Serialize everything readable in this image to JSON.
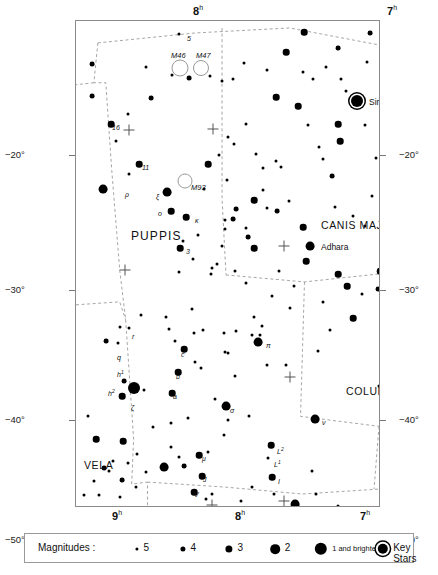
{
  "chart_data": {
    "type": "scatter",
    "xlabel": "Right Ascension",
    "ylabel": "Declination",
    "xlim_hours": [
      9,
      6
    ],
    "ylim_deg": [
      -50,
      -12
    ],
    "grid": false,
    "ra_ticks_top": [
      {
        "label": "8",
        "sup": "h",
        "x": 118
      },
      {
        "label": "7",
        "sup": "h",
        "x": 312
      }
    ],
    "ra_ticks_bottom": [
      {
        "label": "9",
        "sup": "h",
        "x": 37
      },
      {
        "label": "8",
        "sup": "h",
        "x": 160
      },
      {
        "label": "7",
        "sup": "h",
        "x": 285
      },
      {
        "label": "6",
        "sup": "h",
        "x": 394
      }
    ],
    "dec_ticks_left": [
      {
        "label": "−20°",
        "y": 135
      },
      {
        "label": "−30°",
        "y": 270
      },
      {
        "label": "−40°",
        "y": 400
      },
      {
        "label": "−50°",
        "y": 520
      }
    ],
    "dec_ticks_right": [
      {
        "label": "−20°",
        "y": 135
      },
      {
        "label": "−30°",
        "y": 270
      },
      {
        "label": "−40°",
        "y": 400
      },
      {
        "label": "−50°",
        "y": 520
      }
    ],
    "constellations": [
      {
        "name": "PUPPIS",
        "x": 55,
        "y": 208,
        "size": "big"
      },
      {
        "name": "CANIS MAJOR",
        "x": 245,
        "y": 198,
        "size": "norm"
      },
      {
        "name": "PYXIS",
        "x": -35,
        "y": 266,
        "size": "norm"
      },
      {
        "name": "COLUMBA",
        "x": 270,
        "y": 364,
        "size": "norm"
      },
      {
        "name": "VELA",
        "x": 8,
        "y": 438,
        "size": "norm"
      },
      {
        "name": "CARINA",
        "x": 120,
        "y": 498,
        "size": "norm"
      }
    ],
    "named_stars": [
      {
        "name": "Sirius",
        "x": 281,
        "y": 80,
        "label_dx": 12,
        "label_dy": -4
      },
      {
        "name": "Adhara",
        "x": 234,
        "y": 225,
        "label_dx": 11,
        "label_dy": -4
      }
    ],
    "deep_sky": [
      {
        "name": "M46",
        "x": 104,
        "y": 47,
        "r": 7.5,
        "label_dx": -9,
        "label_dy": -17
      },
      {
        "name": "M47",
        "x": 125,
        "y": 47,
        "r": 7.0,
        "label_dx": -5,
        "label_dy": -17
      },
      {
        "name": "M93",
        "x": 109,
        "y": 160,
        "r": 6.5,
        "label_dx": 6,
        "label_dy": 2
      }
    ],
    "star_labels": [
      {
        "text": "5",
        "x": 111,
        "y": 14,
        "sup": ""
      },
      {
        "text": "16",
        "x": 36,
        "y": 103,
        "sup": ""
      },
      {
        "text": "11",
        "x": 66,
        "y": 143,
        "sup": ""
      },
      {
        "text": "ρ",
        "x": 49,
        "y": 170,
        "sup": ""
      },
      {
        "text": "ξ",
        "x": 80,
        "y": 172,
        "sup": ""
      },
      {
        "text": "o",
        "x": 82,
        "y": 189,
        "sup": ""
      },
      {
        "text": "κ",
        "x": 119,
        "y": 196,
        "sup": ""
      },
      {
        "text": "3",
        "x": 110,
        "y": 227,
        "sup": ""
      },
      {
        "text": "r",
        "x": 56,
        "y": 312,
        "sup": ""
      },
      {
        "text": "q",
        "x": 41,
        "y": 333,
        "sup": ""
      },
      {
        "text": "c",
        "x": 105,
        "y": 330,
        "sup": ""
      },
      {
        "text": "b",
        "x": 100,
        "y": 352,
        "sup": ""
      },
      {
        "text": "a",
        "x": 97,
        "y": 372,
        "sup": ""
      },
      {
        "text": "h",
        "x": 41,
        "y": 348,
        "sup": "1"
      },
      {
        "text": "h",
        "x": 32,
        "y": 367,
        "sup": "2"
      },
      {
        "text": "ζ",
        "x": 55,
        "y": 383,
        "sup": ""
      },
      {
        "text": "π",
        "x": 190,
        "y": 321,
        "sup": ""
      },
      {
        "text": "σ",
        "x": 154,
        "y": 386,
        "sup": ""
      },
      {
        "text": "ν",
        "x": 246,
        "y": 398,
        "sup": ""
      },
      {
        "text": "L",
        "x": 201,
        "y": 425,
        "sup": "2"
      },
      {
        "text": "L",
        "x": 198,
        "y": 438,
        "sup": "1"
      },
      {
        "text": "I",
        "x": 202,
        "y": 457,
        "sup": ""
      },
      {
        "text": "τ",
        "x": 228,
        "y": 484,
        "sup": ""
      },
      {
        "text": "μ",
        "x": 126,
        "y": 434,
        "sup": ""
      },
      {
        "text": "J",
        "x": 127,
        "y": 455,
        "sup": ""
      },
      {
        "text": "V",
        "x": 118,
        "y": 470,
        "sup": ""
      }
    ],
    "crosses": [
      {
        "x": 53,
        "y": 109
      },
      {
        "x": 49,
        "y": 249
      },
      {
        "x": 137,
        "y": 108
      },
      {
        "x": 208,
        "y": 225
      },
      {
        "x": 214,
        "y": 356
      },
      {
        "x": 136,
        "y": 484
      },
      {
        "x": 208,
        "y": 480
      }
    ],
    "stars": [
      {
        "x": 103,
        "y": 13,
        "m": 5
      },
      {
        "x": 70,
        "y": 46,
        "m": 5
      },
      {
        "x": 16,
        "y": 43,
        "m": 4
      },
      {
        "x": 16,
        "y": 75,
        "m": 4
      },
      {
        "x": 96,
        "y": 54,
        "m": 5
      },
      {
        "x": 113,
        "y": 57,
        "m": 4
      },
      {
        "x": 134,
        "y": 55,
        "m": 5
      },
      {
        "x": 146,
        "y": 60,
        "m": 5
      },
      {
        "x": 75,
        "y": 77,
        "m": 4
      },
      {
        "x": 52,
        "y": 93,
        "m": 5
      },
      {
        "x": 35,
        "y": 103,
        "m": 3
      },
      {
        "x": 40,
        "y": 120,
        "m": 5
      },
      {
        "x": 168,
        "y": 42,
        "m": 5
      },
      {
        "x": 191,
        "y": 49,
        "m": 5
      },
      {
        "x": 157,
        "y": 58,
        "m": 5
      },
      {
        "x": 210,
        "y": 31,
        "m": 3
      },
      {
        "x": 227,
        "y": 51,
        "m": 5
      },
      {
        "x": 250,
        "y": 46,
        "m": 5
      },
      {
        "x": 265,
        "y": 58,
        "m": 5
      },
      {
        "x": 237,
        "y": 58,
        "m": 5
      },
      {
        "x": 270,
        "y": 70,
        "m": 5
      },
      {
        "x": 200,
        "y": 76,
        "m": 3
      },
      {
        "x": 222,
        "y": 85,
        "m": 3
      },
      {
        "x": 262,
        "y": 27,
        "m": 4
      },
      {
        "x": 291,
        "y": 41,
        "m": 5
      },
      {
        "x": 281,
        "y": 80,
        "m": 1,
        "key": true
      },
      {
        "x": 262,
        "y": 103,
        "m": 3
      },
      {
        "x": 264,
        "y": 120,
        "m": 3
      },
      {
        "x": 232,
        "y": 104,
        "m": 5
      },
      {
        "x": 170,
        "y": 103,
        "m": 5
      },
      {
        "x": 152,
        "y": 116,
        "m": 5
      },
      {
        "x": 180,
        "y": 133,
        "m": 5
      },
      {
        "x": 187,
        "y": 147,
        "m": 5
      },
      {
        "x": 63,
        "y": 143,
        "m": 3
      },
      {
        "x": 53,
        "y": 153,
        "m": 5
      },
      {
        "x": 27,
        "y": 168,
        "m": 2
      },
      {
        "x": 91,
        "y": 171,
        "m": 2
      },
      {
        "x": 95,
        "y": 190,
        "m": 3
      },
      {
        "x": 110,
        "y": 196,
        "m": 3
      },
      {
        "x": 104,
        "y": 227,
        "m": 3
      },
      {
        "x": 107,
        "y": 220,
        "m": 5
      },
      {
        "x": 122,
        "y": 214,
        "m": 5
      },
      {
        "x": 132,
        "y": 143,
        "m": 3
      },
      {
        "x": 128,
        "y": 168,
        "m": 5
      },
      {
        "x": 143,
        "y": 134,
        "m": 5
      },
      {
        "x": 151,
        "y": 159,
        "m": 5
      },
      {
        "x": 158,
        "y": 123,
        "m": 5
      },
      {
        "x": 149,
        "y": 199,
        "m": 5
      },
      {
        "x": 136,
        "y": 247,
        "m": 5
      },
      {
        "x": 141,
        "y": 243,
        "m": 5
      },
      {
        "x": 205,
        "y": 146,
        "m": 5
      },
      {
        "x": 200,
        "y": 140,
        "m": 5
      },
      {
        "x": 187,
        "y": 169,
        "m": 5
      },
      {
        "x": 213,
        "y": 180,
        "m": 5
      },
      {
        "x": 178,
        "y": 179,
        "m": 3
      },
      {
        "x": 191,
        "y": 187,
        "m": 5
      },
      {
        "x": 201,
        "y": 190,
        "m": 4
      },
      {
        "x": 160,
        "y": 188,
        "m": 4
      },
      {
        "x": 157,
        "y": 198,
        "m": 4
      },
      {
        "x": 170,
        "y": 207,
        "m": 5
      },
      {
        "x": 149,
        "y": 208,
        "m": 5
      },
      {
        "x": 172,
        "y": 216,
        "m": 4
      },
      {
        "x": 178,
        "y": 227,
        "m": 3
      },
      {
        "x": 234,
        "y": 225,
        "m": 2
      },
      {
        "x": 227,
        "y": 206,
        "m": 3
      },
      {
        "x": 247,
        "y": 138,
        "m": 5
      },
      {
        "x": 256,
        "y": 155,
        "m": 4
      },
      {
        "x": 146,
        "y": 225,
        "m": 5
      },
      {
        "x": 117,
        "y": 238,
        "m": 5
      },
      {
        "x": 159,
        "y": 250,
        "m": 5
      },
      {
        "x": 304,
        "y": 250,
        "m": 3
      },
      {
        "x": 302,
        "y": 268,
        "m": 4
      },
      {
        "x": 135,
        "y": 253,
        "m": 5
      },
      {
        "x": 103,
        "y": 251,
        "m": 5
      },
      {
        "x": 170,
        "y": 262,
        "m": 5
      },
      {
        "x": 196,
        "y": 275,
        "m": 5
      },
      {
        "x": 116,
        "y": 288,
        "m": 5
      },
      {
        "x": 90,
        "y": 296,
        "m": 5
      },
      {
        "x": 65,
        "y": 294,
        "m": 5
      },
      {
        "x": 44,
        "y": 306,
        "m": 5
      },
      {
        "x": 53,
        "y": 307,
        "m": 5
      },
      {
        "x": 93,
        "y": 308,
        "m": 5
      },
      {
        "x": 108,
        "y": 328,
        "m": 3
      },
      {
        "x": 99,
        "y": 320,
        "m": 5
      },
      {
        "x": 118,
        "y": 312,
        "m": 5
      },
      {
        "x": 127,
        "y": 309,
        "m": 5
      },
      {
        "x": 30,
        "y": 320,
        "m": 4
      },
      {
        "x": 42,
        "y": 322,
        "m": 5
      },
      {
        "x": 102,
        "y": 351,
        "m": 3
      },
      {
        "x": 119,
        "y": 341,
        "m": 5
      },
      {
        "x": 125,
        "y": 347,
        "m": 5
      },
      {
        "x": 96,
        "y": 372,
        "m": 3
      },
      {
        "x": 58,
        "y": 367,
        "m": 1
      },
      {
        "x": 48,
        "y": 360,
        "m": 4
      },
      {
        "x": 46,
        "y": 375,
        "m": 3
      },
      {
        "x": 68,
        "y": 369,
        "m": 5
      },
      {
        "x": 149,
        "y": 331,
        "m": 5
      },
      {
        "x": 150,
        "y": 385,
        "m": 2
      },
      {
        "x": 12,
        "y": 395,
        "m": 5
      },
      {
        "x": 20,
        "y": 418,
        "m": 3
      },
      {
        "x": 47,
        "y": 420,
        "m": 3
      },
      {
        "x": 160,
        "y": 310,
        "m": 5
      },
      {
        "x": 178,
        "y": 296,
        "m": 5
      },
      {
        "x": 186,
        "y": 305,
        "m": 5
      },
      {
        "x": 182,
        "y": 321,
        "m": 2
      },
      {
        "x": 176,
        "y": 314,
        "m": 5
      },
      {
        "x": 184,
        "y": 314,
        "m": 5
      },
      {
        "x": 214,
        "y": 287,
        "m": 5
      },
      {
        "x": 152,
        "y": 332,
        "m": 5
      },
      {
        "x": 148,
        "y": 312,
        "m": 5
      },
      {
        "x": 218,
        "y": 265,
        "m": 5
      },
      {
        "x": 203,
        "y": 250,
        "m": 5
      },
      {
        "x": 230,
        "y": 240,
        "m": 3
      },
      {
        "x": 262,
        "y": 253,
        "m": 3
      },
      {
        "x": 271,
        "y": 265,
        "m": 3
      },
      {
        "x": 286,
        "y": 273,
        "m": 5
      },
      {
        "x": 277,
        "y": 297,
        "m": 3
      },
      {
        "x": 247,
        "y": 281,
        "m": 5
      },
      {
        "x": 254,
        "y": 309,
        "m": 5
      },
      {
        "x": 242,
        "y": 330,
        "m": 5
      },
      {
        "x": 210,
        "y": 344,
        "m": 5
      },
      {
        "x": 191,
        "y": 344,
        "m": 5
      },
      {
        "x": 159,
        "y": 355,
        "m": 5
      },
      {
        "x": 139,
        "y": 378,
        "m": 5
      },
      {
        "x": 152,
        "y": 399,
        "m": 5
      },
      {
        "x": 148,
        "y": 414,
        "m": 5
      },
      {
        "x": 173,
        "y": 395,
        "m": 5
      },
      {
        "x": 239,
        "y": 398,
        "m": 2
      },
      {
        "x": 195,
        "y": 424,
        "m": 3
      },
      {
        "x": 192,
        "y": 437,
        "m": 5
      },
      {
        "x": 196,
        "y": 456,
        "m": 3
      },
      {
        "x": 236,
        "y": 450,
        "m": 5
      },
      {
        "x": 176,
        "y": 466,
        "m": 5
      },
      {
        "x": 198,
        "y": 473,
        "m": 5
      },
      {
        "x": 240,
        "y": 473,
        "m": 5
      },
      {
        "x": 165,
        "y": 480,
        "m": 5
      },
      {
        "x": 219,
        "y": 483,
        "m": 2
      },
      {
        "x": 262,
        "y": 485,
        "m": 5
      },
      {
        "x": 130,
        "y": 478,
        "m": 5
      },
      {
        "x": 231,
        "y": 495,
        "m": 5
      },
      {
        "x": 133,
        "y": 492,
        "m": 4
      },
      {
        "x": 95,
        "y": 402,
        "m": 5
      },
      {
        "x": 77,
        "y": 406,
        "m": 5
      },
      {
        "x": 112,
        "y": 397,
        "m": 5
      },
      {
        "x": 95,
        "y": 426,
        "m": 5
      },
      {
        "x": 61,
        "y": 433,
        "m": 5
      },
      {
        "x": 108,
        "y": 445,
        "m": 4
      },
      {
        "x": 123,
        "y": 434,
        "m": 3
      },
      {
        "x": 132,
        "y": 431,
        "m": 5
      },
      {
        "x": 126,
        "y": 455,
        "m": 3
      },
      {
        "x": 118,
        "y": 471,
        "m": 3
      },
      {
        "x": 136,
        "y": 473,
        "m": 5
      },
      {
        "x": 103,
        "y": 436,
        "m": 5
      },
      {
        "x": 88,
        "y": 446,
        "m": 2
      },
      {
        "x": 70,
        "y": 451,
        "m": 5
      },
      {
        "x": 52,
        "y": 442,
        "m": 5
      },
      {
        "x": 37,
        "y": 440,
        "m": 5
      },
      {
        "x": 28,
        "y": 447,
        "m": 4
      },
      {
        "x": 33,
        "y": 450,
        "m": 5
      },
      {
        "x": 18,
        "y": 460,
        "m": 5
      },
      {
        "x": 46,
        "y": 459,
        "m": 4
      },
      {
        "x": 60,
        "y": 466,
        "m": 5
      },
      {
        "x": 8,
        "y": 474,
        "m": 5
      },
      {
        "x": 23,
        "y": 474,
        "m": 5
      },
      {
        "x": 44,
        "y": 476,
        "m": 5
      },
      {
        "x": 64,
        "y": 489,
        "m": 5
      },
      {
        "x": 89,
        "y": 492,
        "m": 5
      },
      {
        "x": 305,
        "y": 60,
        "m": 5
      },
      {
        "x": 294,
        "y": 12,
        "m": 4
      },
      {
        "x": 228,
        "y": 11,
        "m": 3
      },
      {
        "x": 243,
        "y": 126,
        "m": 5
      },
      {
        "x": 303,
        "y": 365,
        "m": 5
      },
      {
        "x": 289,
        "y": 205,
        "m": 5
      },
      {
        "x": 296,
        "y": 175,
        "m": 5
      },
      {
        "x": 259,
        "y": 186,
        "m": 5
      },
      {
        "x": 277,
        "y": 195,
        "m": 5
      },
      {
        "x": 300,
        "y": 137,
        "m": 5
      },
      {
        "x": 289,
        "y": 104,
        "m": 5
      }
    ]
  },
  "legend": {
    "title": "Magnitudes :",
    "items": [
      {
        "label": "5",
        "x": 112,
        "r": 1.6,
        "key": false,
        "small": false
      },
      {
        "label": "4",
        "x": 158,
        "r": 2.6,
        "key": false,
        "small": false
      },
      {
        "label": "3",
        "x": 204,
        "r": 3.6,
        "key": false,
        "small": false
      },
      {
        "label": "2",
        "x": 250,
        "r": 4.8,
        "key": false,
        "small": false
      },
      {
        "label": "1 and brighter",
        "x": 296,
        "r": 6.2,
        "key": false,
        "small": true
      },
      {
        "label": "Key Stars",
        "x": 358,
        "r": 5.2,
        "key": true,
        "small": false
      }
    ]
  }
}
